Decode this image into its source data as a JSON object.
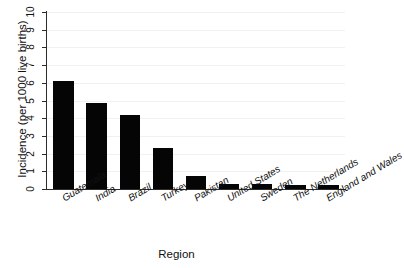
{
  "chart_data": {
    "type": "bar",
    "title": "",
    "xlabel": "Region",
    "ylabel": "Incidence (per 1000 live births)",
    "categories": [
      "Guatemala",
      "India",
      "Brazil",
      "Turkey",
      "Pakistan",
      "United States",
      "Sweden",
      "The Netherlands",
      "England and Wales"
    ],
    "values": [
      6.1,
      4.85,
      4.2,
      2.3,
      0.75,
      0.3,
      0.3,
      0.25,
      0.25
    ],
    "ylim": [
      0,
      10
    ],
    "yticks": [
      0,
      1,
      2,
      3,
      4,
      5,
      6,
      7,
      8,
      9,
      10
    ],
    "ytick_labels": [
      "0",
      "1",
      "2",
      "3",
      "4",
      "5",
      "6",
      "7",
      "8",
      "9",
      "10"
    ],
    "grid": true,
    "legend": false,
    "bar_color": "#050505",
    "background_color": "#ffffff",
    "axis_color": "#2b2b2b"
  }
}
